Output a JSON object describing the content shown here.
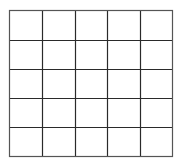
{
  "diagram": {
    "type": "grid",
    "rows": 5,
    "columns": 5,
    "line_color": "#2a2a2a",
    "outer_line_color": "#555555",
    "background": "#ffffff",
    "cells": [
      [
        "",
        "",
        "",
        "",
        ""
      ],
      [
        "",
        "",
        "",
        "",
        ""
      ],
      [
        "",
        "",
        "",
        "",
        ""
      ],
      [
        "",
        "",
        "",
        "",
        ""
      ],
      [
        "",
        "",
        "",
        "",
        ""
      ]
    ]
  }
}
